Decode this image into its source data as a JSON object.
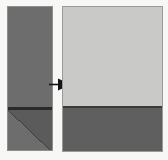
{
  "figure": {
    "type": "before-after-transformation-diagram",
    "background_color": "#f7f7f6",
    "source_panel": {
      "name": "source-panel",
      "color": "#6d6d6d",
      "border_color": "#8d8d8d",
      "x": 7,
      "y": 6,
      "width": 46,
      "height": 145,
      "divider": {
        "name": "horizontal-divider",
        "color": "#2a2a2a",
        "y_offset": 100,
        "thickness": 3
      },
      "lower_section": {
        "name": "diagonal-split-section",
        "upper_triangle_color": "#6d6d6d",
        "lower_triangle_color": "#5b5b5b",
        "diagonal_line_color": "#3d3d3d",
        "diagonal_direction": "bottom-left-to-top-right"
      }
    },
    "arrow": {
      "name": "transform-arrow",
      "direction": "right",
      "color": "#141414",
      "x": 49,
      "y": 78,
      "width": 22,
      "height": 13
    },
    "result_panel": {
      "name": "result-panel",
      "border_color": "#9a9a9a",
      "x": 62,
      "y": 6,
      "width": 101,
      "height": 146,
      "upper_region": {
        "name": "upper-light-region",
        "color": "#c9c9c7",
        "height": 99
      },
      "divider": {
        "name": "horizontal-divider",
        "color": "#3a3a3a",
        "thickness": 2
      },
      "lower_region": {
        "name": "lower-dark-region",
        "color": "#5f5f5f",
        "height": 45
      }
    }
  }
}
